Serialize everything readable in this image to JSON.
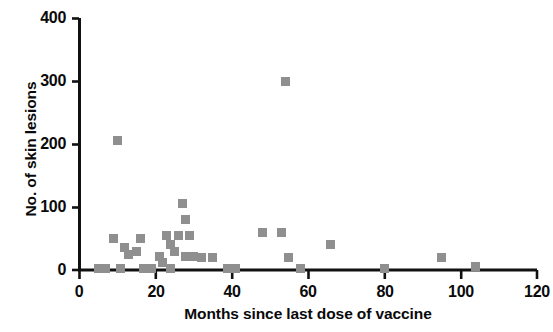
{
  "chart_data": {
    "type": "scatter",
    "title": "",
    "xlabel": "Months since last dose of vaccine",
    "ylabel": "No. of skin lesions",
    "xlim": [
      0,
      120
    ],
    "ylim": [
      0,
      400
    ],
    "xticks": [
      0,
      20,
      40,
      60,
      80,
      100,
      120
    ],
    "yticks": [
      0,
      100,
      200,
      300,
      400
    ],
    "xtick_labels": [
      "0",
      "20",
      "40",
      "60",
      "80",
      "100",
      "120"
    ],
    "ytick_labels": [
      "0",
      "100",
      "200",
      "300",
      "400"
    ],
    "grid": false,
    "legend": null,
    "marker": {
      "shape": "square",
      "color": "#8f8f8f",
      "size_px": 9
    },
    "series": [
      {
        "name": "Patients",
        "points": [
          [
            5,
            3
          ],
          [
            7,
            3
          ],
          [
            9,
            50
          ],
          [
            10,
            205
          ],
          [
            11,
            3
          ],
          [
            12,
            35
          ],
          [
            13,
            25
          ],
          [
            15,
            30
          ],
          [
            16,
            50
          ],
          [
            17,
            3
          ],
          [
            19,
            3
          ],
          [
            21,
            22
          ],
          [
            22,
            12
          ],
          [
            23,
            55
          ],
          [
            24,
            3
          ],
          [
            24,
            40
          ],
          [
            25,
            30
          ],
          [
            26,
            55
          ],
          [
            27,
            105
          ],
          [
            28,
            80
          ],
          [
            28,
            22
          ],
          [
            29,
            55
          ],
          [
            30,
            22
          ],
          [
            32,
            20
          ],
          [
            35,
            20
          ],
          [
            39,
            3
          ],
          [
            41,
            3
          ],
          [
            48,
            60
          ],
          [
            53,
            60
          ],
          [
            54,
            300
          ],
          [
            55,
            20
          ],
          [
            58,
            3
          ],
          [
            66,
            40
          ],
          [
            80,
            3
          ],
          [
            95,
            20
          ],
          [
            104,
            5
          ]
        ]
      }
    ]
  },
  "axis_geometry": {
    "x0_px": 79,
    "x_px_per_unit": 3.817,
    "y0_px": 270,
    "y_px_per_unit": 0.63
  }
}
